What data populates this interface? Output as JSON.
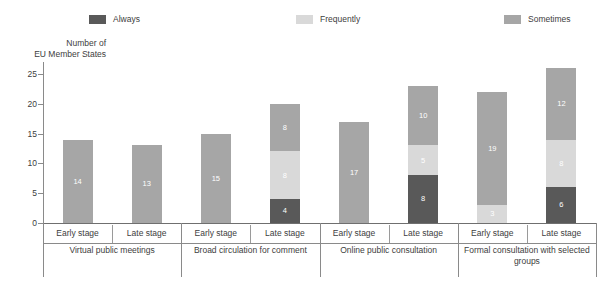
{
  "chart_data": {
    "type": "bar",
    "subtype": "stacked-vertical-grouped",
    "title": "",
    "xlabel": "",
    "ylabel": "Number of\nEU Member States",
    "ylabel_line1": "Number of",
    "ylabel_line2": "EU Member States",
    "ylim": [
      0,
      27
    ],
    "yticks": [
      0,
      5,
      10,
      15,
      20,
      25
    ],
    "ytick_labels": [
      "0",
      "5",
      "10",
      "15",
      "20",
      "25"
    ],
    "grid": false,
    "legend_position": "top",
    "legend": [
      {
        "label": "Always",
        "color": "#595959"
      },
      {
        "label": "Frequently",
        "color": "#d9d9d9"
      },
      {
        "label": "Sometimes",
        "color": "#a6a6a6"
      }
    ],
    "series": [
      {
        "name": "Always",
        "color": "#595959",
        "values": [
          0,
          0,
          0,
          4,
          0,
          8,
          0,
          6
        ]
      },
      {
        "name": "Frequently",
        "color": "#d9d9d9",
        "values": [
          0,
          0,
          0,
          8,
          0,
          5,
          3,
          8
        ]
      },
      {
        "name": "Sometimes",
        "color": "#a6a6a6",
        "values": [
          14,
          13,
          15,
          8,
          17,
          10,
          19,
          12
        ]
      }
    ],
    "categories": [
      "Early stage",
      "Late stage",
      "Early stage",
      "Late stage",
      "Early stage",
      "Late stage",
      "Early stage",
      "Late stage"
    ],
    "group_labels": [
      "Virtual public meetings",
      "Broad circulation for comment",
      "Online public consultation",
      "Formal consultation with selected groups"
    ],
    "group_totals": [
      14,
      13,
      15,
      20,
      17,
      23,
      22,
      26
    ],
    "bars": [
      {
        "group": "Virtual public meetings",
        "stage": "Early stage",
        "segments": [
          {
            "series": "Always",
            "value": 0,
            "label": ""
          },
          {
            "series": "Frequently",
            "value": 0,
            "label": ""
          },
          {
            "series": "Sometimes",
            "value": 14,
            "label": "14"
          }
        ],
        "total": 14
      },
      {
        "group": "Virtual public meetings",
        "stage": "Late stage",
        "segments": [
          {
            "series": "Always",
            "value": 0,
            "label": ""
          },
          {
            "series": "Frequently",
            "value": 0,
            "label": ""
          },
          {
            "series": "Sometimes",
            "value": 13,
            "label": "13"
          }
        ],
        "total": 13
      },
      {
        "group": "Broad circulation for comment",
        "stage": "Early stage",
        "segments": [
          {
            "series": "Always",
            "value": 0,
            "label": ""
          },
          {
            "series": "Frequently",
            "value": 0,
            "label": ""
          },
          {
            "series": "Sometimes",
            "value": 15,
            "label": "15"
          }
        ],
        "total": 15
      },
      {
        "group": "Broad circulation for comment",
        "stage": "Late stage",
        "segments": [
          {
            "series": "Always",
            "value": 4,
            "label": "4"
          },
          {
            "series": "Frequently",
            "value": 8,
            "label": "8"
          },
          {
            "series": "Sometimes",
            "value": 8,
            "label": "8"
          }
        ],
        "total": 20
      },
      {
        "group": "Online public consultation",
        "stage": "Early stage",
        "segments": [
          {
            "series": "Always",
            "value": 0,
            "label": ""
          },
          {
            "series": "Frequently",
            "value": 0,
            "label": ""
          },
          {
            "series": "Sometimes",
            "value": 17,
            "label": "17"
          }
        ],
        "total": 17
      },
      {
        "group": "Online public consultation",
        "stage": "Late stage",
        "segments": [
          {
            "series": "Always",
            "value": 8,
            "label": "8"
          },
          {
            "series": "Frequently",
            "value": 5,
            "label": "5"
          },
          {
            "series": "Sometimes",
            "value": 10,
            "label": "10"
          }
        ],
        "total": 23
      },
      {
        "group": "Formal consultation with selected groups",
        "stage": "Early stage",
        "segments": [
          {
            "series": "Always",
            "value": 0,
            "label": ""
          },
          {
            "series": "Frequently",
            "value": 3,
            "label": "3"
          },
          {
            "series": "Sometimes",
            "value": 19,
            "label": "19"
          }
        ],
        "total": 22
      },
      {
        "group": "Formal consultation with selected groups",
        "stage": "Late stage",
        "segments": [
          {
            "series": "Always",
            "value": 6,
            "label": "6"
          },
          {
            "series": "Frequently",
            "value": 8,
            "label": "8"
          },
          {
            "series": "Sometimes",
            "value": 12,
            "label": "12"
          }
        ],
        "total": 26
      }
    ]
  },
  "colors": {
    "always": "#595959",
    "frequently": "#d9d9d9",
    "sometimes": "#a6a6a6",
    "axis": "#8a8a8a",
    "text": "#404040",
    "background": "#ffffff",
    "value_label": "#ffffff"
  }
}
